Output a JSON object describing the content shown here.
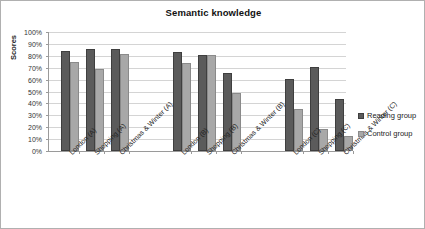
{
  "chart_data": {
    "type": "bar",
    "title": "Semantic knowledge",
    "xlabel": "",
    "ylabel": "Scores",
    "ylim": [
      0,
      100
    ],
    "ytick_labels": [
      "100%",
      "90%",
      "80%",
      "70%",
      "60%",
      "50%",
      "40%",
      "30%",
      "20%",
      "10%",
      "0%"
    ],
    "ytick_values": [
      100,
      90,
      80,
      70,
      60,
      50,
      40,
      30,
      20,
      10,
      0
    ],
    "grid": true,
    "legend_position": "right",
    "categories": [
      "London (A)",
      "Shopping (A)",
      "Christmas & Winter (A)",
      "London (B)",
      "Shopping (B)",
      "Christmas & Winter (B)",
      "London (C)",
      "Shopping (C)",
      "Christmas & Winter (C)"
    ],
    "series": [
      {
        "name": "Reading group",
        "color": "#5b5b5b",
        "values": [
          84,
          85.5,
          86,
          83.5,
          80.5,
          65.5,
          60.5,
          70.5,
          44
        ]
      },
      {
        "name": "Control group",
        "color": "#a8a8a8",
        "values": [
          75,
          69,
          81.5,
          74,
          81,
          49,
          35,
          18.5,
          12.5
        ]
      }
    ]
  },
  "legend": {
    "items": [
      {
        "label": "Reading group"
      },
      {
        "label": "Control group"
      }
    ]
  }
}
